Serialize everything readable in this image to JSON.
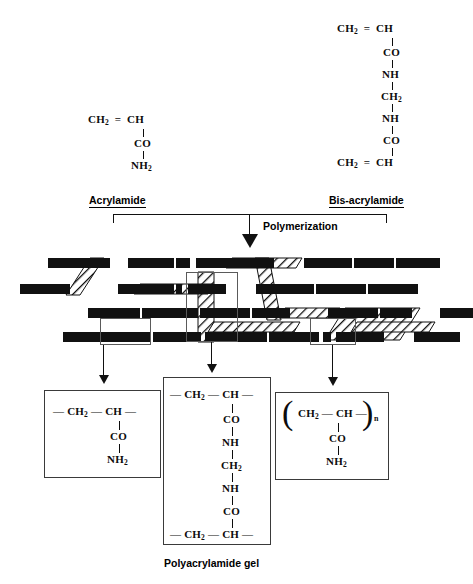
{
  "figure": {
    "caption": "Polyacrylamide gel",
    "process_label": "Polymerization"
  },
  "monomers": {
    "acrylamide": {
      "name": "Acrylamide",
      "nodes": [
        "CH2 = CH",
        "CO",
        "NH2"
      ]
    },
    "bis_acrylamide": {
      "name": "Bis-acrylamide",
      "nodes": [
        "CH2 = CH",
        "CO",
        "NH",
        "CH2",
        "NH",
        "CO",
        "CH2 = CH"
      ]
    }
  },
  "monomer_text": {
    "ch2": "CH",
    "ch2_sub": "2",
    "double_bond": "=",
    "ch": "CH",
    "co": "CO",
    "nh": "NH",
    "nh2": "NH",
    "nh2_sub": "2",
    "dash": "—",
    "n_sub": "n"
  },
  "detail_boxes": [
    {
      "id": "linear-chain-unit",
      "nodes": [
        "— CH2 — CH —",
        "CO",
        "NH2"
      ]
    },
    {
      "id": "crosslink-unit",
      "nodes": [
        "— CH2 — CH —",
        "CO",
        "NH",
        "CH2",
        "NH",
        "CO",
        "— CH2 — CH —"
      ]
    },
    {
      "id": "repeat-unit",
      "nodes": [
        "( CH2 — CH — )n",
        "CO",
        "NH2"
      ]
    }
  ],
  "gel": {
    "chain_color": "#111111",
    "crosslink_fill": "#ffffff",
    "crosslink_hatch": "#111111",
    "rows": 4
  },
  "colors": {
    "ink": "#0c0c0c",
    "line": "#111111",
    "callout_border": "#5a5a5a",
    "box_border": "#3a3a3a",
    "background": "#ffffff"
  }
}
